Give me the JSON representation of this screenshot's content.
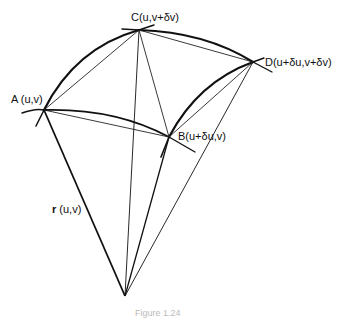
{
  "figure": {
    "type": "surface-patch-diagram",
    "points": {
      "A": {
        "label": "A (u,v)",
        "x": 44,
        "y": 110
      },
      "B": {
        "label": "B(u+δu,v)",
        "x": 169,
        "y": 137
      },
      "C": {
        "label": "C(u,v+δv)",
        "x": 139,
        "y": 30
      },
      "D": {
        "label": "D(u+δu,v+δv)",
        "x": 253,
        "y": 62
      },
      "O": {
        "x": 125,
        "y": 296
      }
    },
    "vector_label": "r (u,v)",
    "vector_label_bold": "r",
    "vector_label_rest": " (u,v)",
    "caption": "Figure 1.24"
  }
}
